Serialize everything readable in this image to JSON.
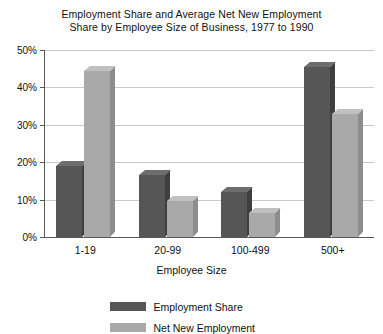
{
  "chart_data": {
    "type": "bar",
    "title": "Employment Share and Average Net New Employment Share by Employee Size of Business, 1977 to 1990",
    "title_line1": "Employment Share and Average Net New Employment",
    "title_line2": "Share by Employee Size of Business, 1977 to 1990",
    "xlabel": "Employee Size",
    "ylabel": "",
    "categories": [
      "1-19",
      "20-99",
      "100-499",
      "500+"
    ],
    "series": [
      {
        "name": "Employment Share",
        "color": "#565656",
        "values": [
          19,
          16.5,
          12,
          45.5
        ]
      },
      {
        "name": "Net New Employment",
        "color": "#a9a9a9",
        "values": [
          44.5,
          9.5,
          6.5,
          33
        ]
      }
    ],
    "ylim": [
      0,
      50
    ],
    "ytick_labels": [
      "50%",
      "40%",
      "30%",
      "20%",
      "10%",
      "0%"
    ],
    "ytick_values": [
      50,
      40,
      30,
      20,
      10,
      0
    ],
    "grid": true,
    "legend_position": "bottom-center",
    "style": "3d-columns"
  },
  "legend": {
    "items": [
      {
        "label": "Employment Share",
        "swatch": "dark"
      },
      {
        "label": "Net New Employment",
        "swatch": "light"
      }
    ]
  }
}
